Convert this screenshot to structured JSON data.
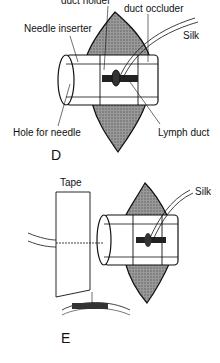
{
  "panel_d": {
    "letter": "D",
    "labels": {
      "duct_holder": "duct holder",
      "duct_occluder": "duct occluder",
      "needle_inserter": "Needle inserter",
      "silk": "Silk",
      "hole_for_needle": "Hole for needle",
      "lymph_duct": "Lymph duct"
    }
  },
  "panel_e": {
    "letter": "E",
    "labels": {
      "tape": "Tape",
      "silk": "Silk"
    }
  },
  "colors": {
    "ink": "#111111",
    "shade": "#8a8a8a",
    "background": "#ffffff"
  }
}
